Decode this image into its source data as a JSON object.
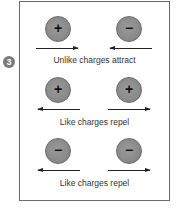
{
  "step_number": "3",
  "rows": [
    {
      "left_charge": {
        "sign": "+",
        "arrow": "right"
      },
      "right_charge": {
        "sign": "−",
        "arrow": "left"
      },
      "caption": "Unlike charges attract"
    },
    {
      "left_charge": {
        "sign": "+",
        "arrow": "left"
      },
      "right_charge": {
        "sign": "+",
        "arrow": "right"
      },
      "caption": "Like charges repel"
    },
    {
      "left_charge": {
        "sign": "−",
        "arrow": "left"
      },
      "right_charge": {
        "sign": "−",
        "arrow": "right"
      },
      "caption": "Like charges repel"
    }
  ],
  "colors": {
    "charge_fill": "#8a8a8a",
    "border": "#6b6b6b",
    "arrow": "#222222",
    "text": "#333333"
  }
}
